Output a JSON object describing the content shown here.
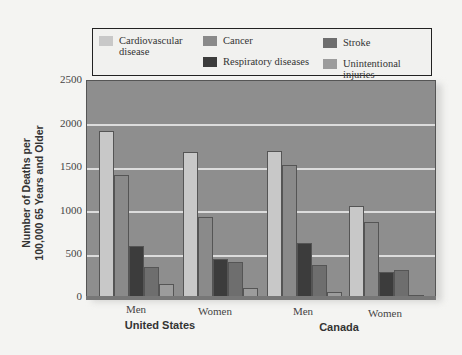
{
  "chart_data": {
    "type": "bar",
    "title": "",
    "xlabel": "",
    "ylabel": "Number of Deaths per 100,000 65 Years and Older",
    "ylim": [
      0,
      2500
    ],
    "yticks": [
      0,
      500,
      1000,
      1500,
      2000,
      2500
    ],
    "grid": true,
    "legend_position": "top",
    "groups": [
      "United States",
      "Canada"
    ],
    "categories": [
      "Men",
      "Women",
      "Men",
      "Women"
    ],
    "category_groups": [
      "United States",
      "United States",
      "Canada",
      "Canada"
    ],
    "series": [
      {
        "name": "Cardiovascular disease",
        "color": "#c8c8c8",
        "values": [
          1900,
          1660,
          1680,
          1040
        ]
      },
      {
        "name": "Cancer",
        "color": "#8a8a8a",
        "values": [
          1400,
          920,
          1510,
          860
        ]
      },
      {
        "name": "Respiratory diseases",
        "color": "#3c3c3c",
        "values": [
          590,
          440,
          620,
          290
        ]
      },
      {
        "name": "Stroke",
        "color": "#6e6e6e",
        "values": [
          340,
          400,
          370,
          310
        ]
      },
      {
        "name": "Unintentional injuries",
        "color": "#9c9c9c",
        "values": [
          150,
          100,
          60,
          20
        ]
      }
    ]
  },
  "legend": {
    "items": [
      {
        "label": "Cardiovascular disease",
        "line1": "Cardiovascular",
        "line2": "disease",
        "color": "#c8c8c8"
      },
      {
        "label": "Cancer",
        "color": "#8a8a8a"
      },
      {
        "label": "Respiratory diseases",
        "color": "#3c3c3c"
      },
      {
        "label": "Stroke",
        "color": "#6e6e6e"
      },
      {
        "label": "Unintentional injuries",
        "color": "#9c9c9c"
      }
    ]
  },
  "axis": {
    "ylabel_line1": "Number of Deaths per",
    "ylabel_line2": "100,000 65 Years and Older",
    "yticks": [
      "2500",
      "2000",
      "1500",
      "1000",
      "500",
      "0"
    ],
    "xcats": [
      "Men",
      "Women",
      "Men",
      "Women"
    ],
    "xgroups": [
      "United States",
      "Canada"
    ]
  }
}
